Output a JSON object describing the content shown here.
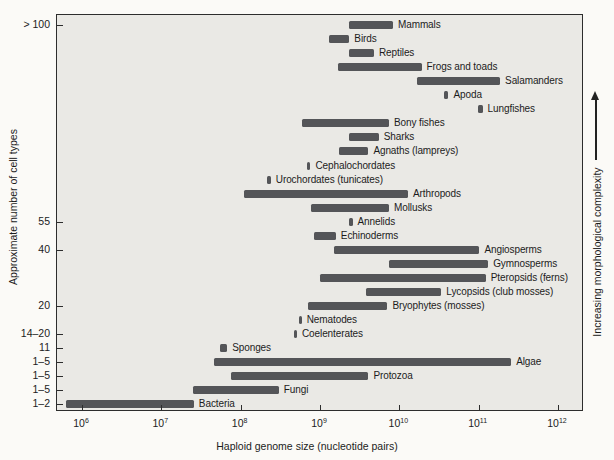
{
  "chart_data": {
    "type": "bar",
    "subtype": "horizontal-range-bars",
    "title": "",
    "xlabel": "Haploid genome size (nucleotide pairs)",
    "ylabel": "Approximate number of cell types",
    "right_label": "Increasing morphological complexity",
    "grid": false,
    "legend": "none",
    "x_axis": {
      "scale": "log10",
      "tick_base": "10",
      "tick_exponents": [
        6,
        7,
        8,
        9,
        10,
        11,
        12
      ],
      "range_log10": [
        5.68,
        12.33
      ]
    },
    "y_axis_ticks": [
      {
        "label": "> 100",
        "row": 0
      },
      {
        "label": "55",
        "row": 14
      },
      {
        "label": "40",
        "row": 16
      },
      {
        "label": "20",
        "row": 20
      },
      {
        "label": "14–20",
        "row": 22
      },
      {
        "label": "11",
        "row": 23
      },
      {
        "label": "1–5",
        "row": 24
      },
      {
        "label": "1–5",
        "row": 25
      },
      {
        "label": "1–5",
        "row": 26
      },
      {
        "label": "1–2",
        "row": 27
      }
    ],
    "series": [
      {
        "label": "Mammals",
        "genome_size_log10": [
          9.37,
          9.92
        ]
      },
      {
        "label": "Birds",
        "genome_size_log10": [
          9.11,
          9.37
        ]
      },
      {
        "label": "Reptiles",
        "genome_size_log10": [
          9.37,
          9.68
        ]
      },
      {
        "label": "Frogs and toads",
        "genome_size_log10": [
          9.23,
          10.28
        ]
      },
      {
        "label": "Salamanders",
        "genome_size_log10": [
          10.22,
          11.27
        ]
      },
      {
        "label": "Apoda",
        "genome_size_log10": [
          10.56,
          10.62
        ]
      },
      {
        "label": "Lungfishes",
        "genome_size_log10": [
          10.99,
          11.05
        ]
      },
      {
        "label": "Bony fishes",
        "genome_size_log10": [
          8.77,
          9.87
        ]
      },
      {
        "label": "Sharks",
        "genome_size_log10": [
          9.37,
          9.74
        ]
      },
      {
        "label": "Agnaths (lampreys)",
        "genome_size_log10": [
          9.24,
          9.61
        ]
      },
      {
        "label": "Cephalochordates",
        "genome_size_log10": [
          8.84,
          8.88
        ]
      },
      {
        "label": "Urochordates (tunicates)",
        "genome_size_log10": [
          8.33,
          8.38
        ]
      },
      {
        "label": "Arthropods",
        "genome_size_log10": [
          8.04,
          10.11
        ]
      },
      {
        "label": "Mollusks",
        "genome_size_log10": [
          8.89,
          9.87
        ]
      },
      {
        "label": "Annelids",
        "genome_size_log10": [
          9.37,
          9.41
        ]
      },
      {
        "label": "Echinoderms",
        "genome_size_log10": [
          8.93,
          9.2
        ]
      },
      {
        "label": "Angiosperms",
        "genome_size_log10": [
          9.18,
          11.01
        ]
      },
      {
        "label": "Gymnosperms",
        "genome_size_log10": [
          9.87,
          11.12
        ]
      },
      {
        "label": "Pteropsids (ferns)",
        "genome_size_log10": [
          9.0,
          11.09
        ]
      },
      {
        "label": "Lycopsids (club mosses)",
        "genome_size_log10": [
          9.58,
          10.53
        ]
      },
      {
        "label": "Bryophytes (mosses)",
        "genome_size_log10": [
          8.85,
          9.85
        ]
      },
      {
        "label": "Nematodes",
        "genome_size_log10": [
          8.73,
          8.77
        ]
      },
      {
        "label": "Coelenterates",
        "genome_size_log10": [
          8.67,
          8.71
        ]
      },
      {
        "label": "Sponges",
        "genome_size_log10": [
          7.74,
          7.83
        ]
      },
      {
        "label": "Algae",
        "genome_size_log10": [
          7.66,
          11.41
        ]
      },
      {
        "label": "Protozoa",
        "genome_size_log10": [
          7.88,
          9.61
        ]
      },
      {
        "label": "Fungi",
        "genome_size_log10": [
          7.4,
          8.48
        ]
      },
      {
        "label": "Bacteria",
        "genome_size_log10": [
          5.8,
          7.41
        ]
      }
    ],
    "colors": {
      "bar": "#545558",
      "plot_bg": "#eae9e5",
      "frame": "#2d2d2d",
      "text": "#1c1c1c",
      "page_bg": "#fbfaf7"
    }
  }
}
